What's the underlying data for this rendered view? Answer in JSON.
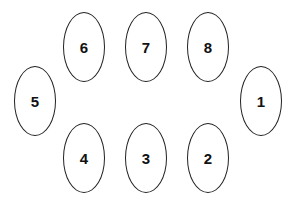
{
  "diagram": {
    "type": "seating-arrangement",
    "stroke_color": "#222222",
    "nodes": [
      {
        "label": "1",
        "cx": 261,
        "cy": 101
      },
      {
        "label": "2",
        "cx": 208,
        "cy": 158
      },
      {
        "label": "3",
        "cx": 146,
        "cy": 158
      },
      {
        "label": "4",
        "cx": 84,
        "cy": 158
      },
      {
        "label": "5",
        "cx": 35,
        "cy": 101
      },
      {
        "label": "6",
        "cx": 84,
        "cy": 47
      },
      {
        "label": "7",
        "cx": 146,
        "cy": 47
      },
      {
        "label": "8",
        "cx": 208,
        "cy": 47
      }
    ]
  }
}
